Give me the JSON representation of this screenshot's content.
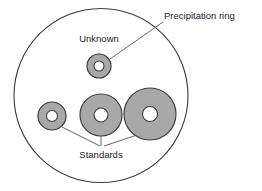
{
  "diagram": {
    "background_color": "#ffffff",
    "labels": {
      "precipitation_ring": "Precipitation ring",
      "unknown": "Unknown",
      "standards": "Standards"
    },
    "colors": {
      "ring_fill": "#a8a8a8",
      "ring_stroke": "#3c3c3c",
      "hole_fill": "#ffffff",
      "plate_stroke": "#3c3c3c",
      "leader_stroke": "#555555",
      "text": "#1d1d1d"
    },
    "plate": {
      "name": "outer-plate-circle",
      "cx": 101,
      "cy": 95.5,
      "r": 87
    },
    "rings": [
      {
        "id": "unknown-ring",
        "group": "unknown",
        "cx": 99,
        "cy": 66,
        "outer_r": 12,
        "hole_r": 5
      },
      {
        "id": "standard-ring-small",
        "group": "standards",
        "cx": 52,
        "cy": 116,
        "outer_r": 14,
        "hole_r": 5.5
      },
      {
        "id": "standard-ring-medium",
        "group": "standards",
        "cx": 101,
        "cy": 115,
        "outer_r": 21,
        "hole_r": 7
      },
      {
        "id": "standard-ring-large",
        "group": "standards",
        "cx": 150,
        "cy": 114,
        "outer_r": 26,
        "hole_r": 7.5
      }
    ],
    "leaders": [
      {
        "id": "leader-precipitation",
        "x1": 110,
        "y1": 59,
        "x2": 163,
        "y2": 22
      },
      {
        "id": "leader-standard-small",
        "x1": 62,
        "y1": 127,
        "x2": 100,
        "y2": 146
      },
      {
        "id": "leader-standard-medium",
        "x1": 101,
        "y1": 136,
        "x2": 101,
        "y2": 146
      },
      {
        "id": "leader-standard-large",
        "x1": 140,
        "y1": 134,
        "x2": 104,
        "y2": 146
      }
    ],
    "label_positions": {
      "precipitation_ring": {
        "x": 164,
        "y": 19,
        "anchor": "start"
      },
      "unknown": {
        "x": 99,
        "y": 42,
        "anchor": "middle"
      },
      "standards": {
        "x": 101,
        "y": 158,
        "anchor": "middle"
      }
    }
  }
}
